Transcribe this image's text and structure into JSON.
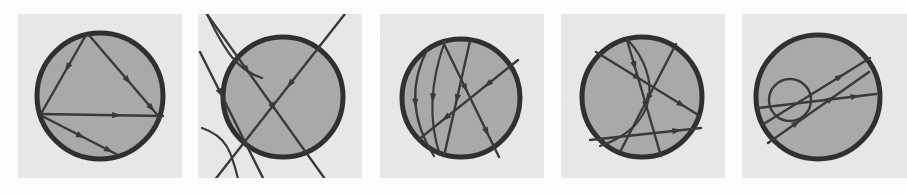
{
  "figure": {
    "title": "",
    "caption": "",
    "panel_count": 5,
    "canvas": {
      "width": 907,
      "height": 194
    },
    "colors": {
      "page_background": "#fdfdfd",
      "panel_background": "#e9e9e9",
      "disk_fill": "#a9a9a9",
      "stroke": "#3a3a3a",
      "boundary_stroke": "#303030"
    },
    "panels": [
      {
        "index": 1,
        "name": "panel-1",
        "label": "",
        "rect": {
          "x": 18,
          "y": 14,
          "width": 164,
          "height": 164
        },
        "circle": {
          "cx": 100,
          "cy": 96,
          "r": 63
        },
        "boundary_width": 5,
        "inner_circles": [],
        "chords": [
          {
            "x1": 86,
            "y1": 35,
            "x2": 42,
            "y2": 112,
            "arrows": [
              0.42
            ]
          },
          {
            "x1": 88,
            "y1": 34,
            "x2": 160,
            "y2": 118,
            "arrows": [
              0.55,
              0.88
            ]
          },
          {
            "x1": 40,
            "y1": 114,
            "x2": 163,
            "y2": 116,
            "arrows": [
              0.62
            ]
          },
          {
            "x1": 40,
            "y1": 115,
            "x2": 118,
            "y2": 155,
            "arrows": [
              0.52,
              0.88
            ]
          }
        ],
        "curves": []
      },
      {
        "index": 2,
        "name": "panel-2",
        "label": "",
        "rect": {
          "x": 198,
          "y": 14,
          "width": 164,
          "height": 164
        },
        "circle": {
          "cx": 283,
          "cy": 97,
          "r": 60
        },
        "boundary_width": 5,
        "inner_circles": [],
        "chords": [
          {
            "x1": 204,
            "y1": 10,
            "x2": 330,
            "y2": 186,
            "arrows": [
              0.34,
              0.55
            ]
          },
          {
            "x1": 348,
            "y1": 10,
            "x2": 210,
            "y2": 186,
            "arrows": [
              0.42
            ]
          },
          {
            "x1": 200,
            "y1": 52,
            "x2": 268,
            "y2": 188,
            "arrows": [
              0.3
            ]
          }
        ],
        "curves": [
          {
            "d": "M 206 12 C 226 54, 238 70, 262 78",
            "arrows": []
          },
          {
            "d": "M 240 188 C 232 150, 226 136, 202 128",
            "arrows": []
          }
        ]
      },
      {
        "index": 3,
        "name": "panel-3",
        "label": "",
        "rect": {
          "x": 380,
          "y": 14,
          "width": 164,
          "height": 164
        },
        "circle": {
          "cx": 461,
          "cy": 98,
          "r": 59
        },
        "boundary_width": 5,
        "inner_circles": [],
        "chords": [
          {
            "x1": 443,
            "y1": 42,
            "x2": 499,
            "y2": 157,
            "arrows": [
              0.4,
              0.78
            ]
          },
          {
            "x1": 470,
            "y1": 41,
            "x2": 444,
            "y2": 156,
            "arrows": [
              0.5
            ]
          },
          {
            "x1": 518,
            "y1": 60,
            "x2": 418,
            "y2": 140,
            "arrows": [
              0.3,
              0.72
            ]
          }
        ],
        "curves": [
          {
            "d": "M 428 48 C 410 82, 410 118, 434 156",
            "arrows": [
              0.5
            ]
          },
          {
            "d": "M 445 41 C 431 80, 428 120, 440 155",
            "arrows": [
              0.5
            ]
          }
        ]
      },
      {
        "index": 4,
        "name": "panel-4",
        "label": "",
        "rect": {
          "x": 561,
          "y": 14,
          "width": 164,
          "height": 164
        },
        "circle": {
          "cx": 642,
          "cy": 97,
          "r": 60
        },
        "boundary_width": 5,
        "inner_circles": [],
        "chords": [
          {
            "x1": 596,
            "y1": 52,
            "x2": 700,
            "y2": 116,
            "arrows": [
              0.4,
              0.82
            ]
          },
          {
            "x1": 627,
            "y1": 40,
            "x2": 661,
            "y2": 156,
            "arrows": [
              0.22,
              0.56
            ]
          },
          {
            "x1": 590,
            "y1": 140,
            "x2": 701,
            "y2": 128,
            "arrows": [
              0.78
            ]
          },
          {
            "x1": 676,
            "y1": 44,
            "x2": 620,
            "y2": 152,
            "arrows": [
              0.5
            ]
          }
        ],
        "curves": [
          {
            "d": "M 628 40 C 662 78, 658 126, 600 146",
            "arrows": []
          }
        ]
      },
      {
        "index": 5,
        "name": "panel-5",
        "label": "",
        "rect": {
          "x": 742,
          "y": 14,
          "width": 165,
          "height": 164
        },
        "circle": {
          "cx": 818,
          "cy": 97,
          "r": 62
        },
        "boundary_width": 5,
        "inner_circles": [
          {
            "cx": 790,
            "cy": 100,
            "r": 21
          }
        ],
        "chords": [
          {
            "x1": 762,
            "y1": 125,
            "x2": 870,
            "y2": 58,
            "arrows": [
              0.72
            ]
          },
          {
            "x1": 758,
            "y1": 108,
            "x2": 876,
            "y2": 94,
            "arrows": [
              0.82
            ]
          },
          {
            "x1": 768,
            "y1": 143,
            "x2": 869,
            "y2": 72,
            "arrows": [
              0.28,
              0.62
            ]
          }
        ],
        "curves": []
      }
    ]
  }
}
